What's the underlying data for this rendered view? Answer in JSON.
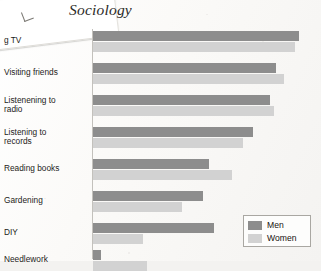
{
  "page": {
    "running_head": "Sociology"
  },
  "legend": {
    "position": "bottom-right",
    "entries": [
      {
        "label": "Men",
        "color": "#8d8d8d"
      },
      {
        "label": "Women",
        "color": "#d2d2d2"
      }
    ]
  },
  "chart_data": {
    "type": "bar",
    "orientation": "horizontal",
    "title": "Sociology",
    "xlabel": "",
    "ylabel": "",
    "grid": false,
    "legend_position": "bottom-right",
    "xlim": [
      0,
      100
    ],
    "categories": [
      "g TV",
      "Visiting friends",
      "Listenening to\nradio",
      "Listening to\nrecords",
      "Reading books",
      "Gardening",
      "DIY",
      "Needlework"
    ],
    "series": [
      {
        "name": "Men",
        "color": "#8d8d8d",
        "values": [
          99,
          88,
          85,
          77,
          56,
          53,
          58,
          4
        ]
      },
      {
        "name": "Women",
        "color": "#d2d2d2",
        "values": [
          97,
          92,
          87,
          72,
          67,
          43,
          24,
          26
        ]
      }
    ]
  }
}
